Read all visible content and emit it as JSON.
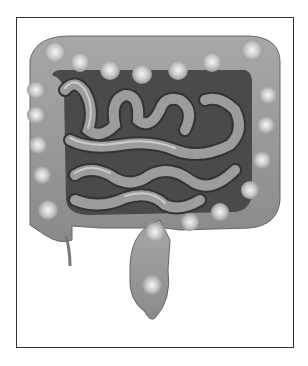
{
  "figure": {
    "colors": {
      "frame_border": "#333333",
      "organ_mid": "#9a9a9a",
      "organ_dark": "#555555",
      "highlight": "#f2f2f2",
      "background": "#ffffff"
    }
  }
}
